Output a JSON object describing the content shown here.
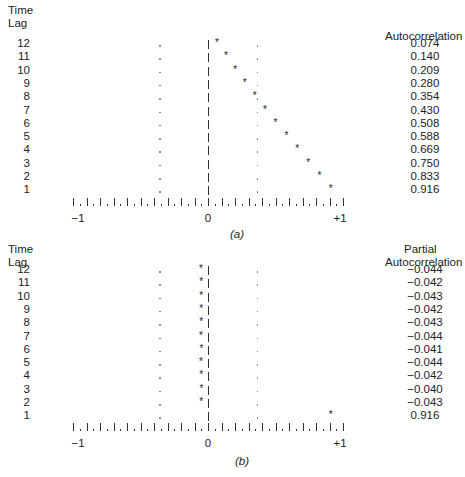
{
  "panel_a": {
    "left_header": [
      "Time",
      "Lag"
    ],
    "right_header": [
      "Autocorrelation"
    ],
    "caption": "(a)",
    "axis_labels": {
      "min": "−1",
      "zero": "0",
      "max": "+1"
    },
    "lags": [
      "12",
      "11",
      "10",
      "9",
      "8",
      "7",
      "6",
      "5",
      "4",
      "3",
      "2",
      "1"
    ],
    "values": [
      "0.074",
      "0.140",
      "0.209",
      "0.280",
      "0.354",
      "0.430",
      "0.508",
      "0.588",
      "0.669",
      "0.750",
      "0.833",
      "0.916"
    ]
  },
  "panel_b": {
    "left_header": [
      "Time",
      "Lag"
    ],
    "right_header": [
      "Partial",
      "Autocorrelation"
    ],
    "caption": "(b)",
    "axis_labels": {
      "min": "−1",
      "zero": "0",
      "max": "+1"
    },
    "lags": [
      "12",
      "11",
      "10",
      "9",
      "8",
      "7",
      "6",
      "5",
      "4",
      "3",
      "2",
      "1"
    ],
    "values": [
      "−0.044",
      "−0.042",
      "−0.043",
      "−0.042",
      "−0.043",
      "−0.044",
      "−0.041",
      "−0.044",
      "−0.042",
      "−0.040",
      "−0.043",
      "0.916"
    ]
  },
  "chart_data": [
    {
      "type": "bar",
      "title": "(a) Autocorrelation function (correlogram)",
      "xlabel": "Autocorrelation",
      "ylabel": "Time Lag",
      "orientation": "horizontal",
      "categories": [
        12,
        11,
        10,
        9,
        8,
        7,
        6,
        5,
        4,
        3,
        2,
        1
      ],
      "values": [
        0.074,
        0.14,
        0.209,
        0.28,
        0.354,
        0.43,
        0.508,
        0.588,
        0.669,
        0.75,
        0.833,
        0.916
      ],
      "xlim": [
        -1,
        1
      ],
      "significance_bounds": [
        -0.36,
        0.36
      ],
      "marker": "*"
    },
    {
      "type": "bar",
      "title": "(b) Partial autocorrelation function",
      "xlabel": "Partial Autocorrelation",
      "ylabel": "Time Lag",
      "orientation": "horizontal",
      "categories": [
        12,
        11,
        10,
        9,
        8,
        7,
        6,
        5,
        4,
        3,
        2,
        1
      ],
      "values": [
        -0.044,
        -0.042,
        -0.043,
        -0.042,
        -0.043,
        -0.044,
        -0.041,
        -0.044,
        -0.042,
        -0.04,
        -0.043,
        0.916
      ],
      "xlim": [
        -1,
        1
      ],
      "significance_bounds": [
        -0.36,
        0.36
      ],
      "marker": "*"
    }
  ]
}
